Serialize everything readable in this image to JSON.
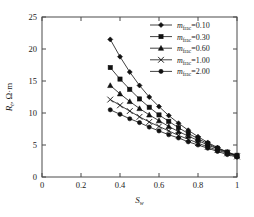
{
  "chart_data": {
    "type": "line",
    "title": "",
    "xlabel": "S_w",
    "xlabel_base": "S",
    "xlabel_sub": "w",
    "ylabel": "R_t, Ω·m",
    "ylabel_base": "R",
    "ylabel_sub": "t",
    "ylabel_unit": ", Ω·m",
    "xlim": [
      0,
      1
    ],
    "ylim": [
      0,
      25
    ],
    "xticks": [
      "0",
      "0.2",
      "0.4",
      "0.6",
      "0.8",
      "1"
    ],
    "xtickvals": [
      0,
      0.2,
      0.4,
      0.6,
      0.8,
      1
    ],
    "yticks": [
      "0",
      "5",
      "10",
      "15",
      "20",
      "25"
    ],
    "ytickvals": [
      0,
      5,
      10,
      15,
      20,
      25
    ],
    "grid": false,
    "legend_position": "top-right",
    "legend_title": "",
    "x": [
      0.35,
      0.4,
      0.45,
      0.5,
      0.55,
      0.6,
      0.65,
      0.7,
      0.75,
      0.8,
      0.85,
      0.9,
      0.95,
      1.0
    ],
    "series": [
      {
        "name": "m_frac=0.10",
        "label_base": "m",
        "label_sub": "frac",
        "label_value": "=0.10",
        "marker": "diamond",
        "color": "#111111",
        "values": [
          21.5,
          18.8,
          16.4,
          14.3,
          12.5,
          11.0,
          9.6,
          8.4,
          7.3,
          6.3,
          5.4,
          4.6,
          3.9,
          3.3
        ]
      },
      {
        "name": "m_frac=0.30",
        "label_base": "m",
        "label_sub": "frac",
        "label_value": "=0.30",
        "marker": "square",
        "color": "#111111",
        "values": [
          17.1,
          15.3,
          13.7,
          12.2,
          10.9,
          9.7,
          8.7,
          7.7,
          6.8,
          6.0,
          5.2,
          4.5,
          3.9,
          3.4
        ]
      },
      {
        "name": "m_frac=0.60",
        "label_base": "m",
        "label_sub": "frac",
        "label_value": "=0.60",
        "marker": "triangle",
        "color": "#111111",
        "values": [
          14.3,
          13.0,
          11.8,
          10.7,
          9.7,
          8.8,
          7.9,
          7.1,
          6.4,
          5.7,
          5.0,
          4.4,
          3.8,
          3.3
        ]
      },
      {
        "name": "m_frac=1.00",
        "label_base": "m",
        "label_sub": "frac",
        "label_value": "=1.00",
        "marker": "cross",
        "color": "#111111",
        "values": [
          12.1,
          11.2,
          10.3,
          9.4,
          8.6,
          7.9,
          7.2,
          6.5,
          5.9,
          5.3,
          4.7,
          4.2,
          3.7,
          3.2
        ]
      },
      {
        "name": "m_frac=2.00",
        "label_base": "m",
        "label_sub": "frac",
        "label_value": "=2.00",
        "marker": "circle",
        "color": "#111111",
        "values": [
          10.5,
          9.8,
          9.1,
          8.5,
          7.8,
          7.2,
          6.6,
          6.1,
          5.5,
          5.0,
          4.5,
          4.0,
          3.5,
          3.1
        ]
      }
    ]
  }
}
